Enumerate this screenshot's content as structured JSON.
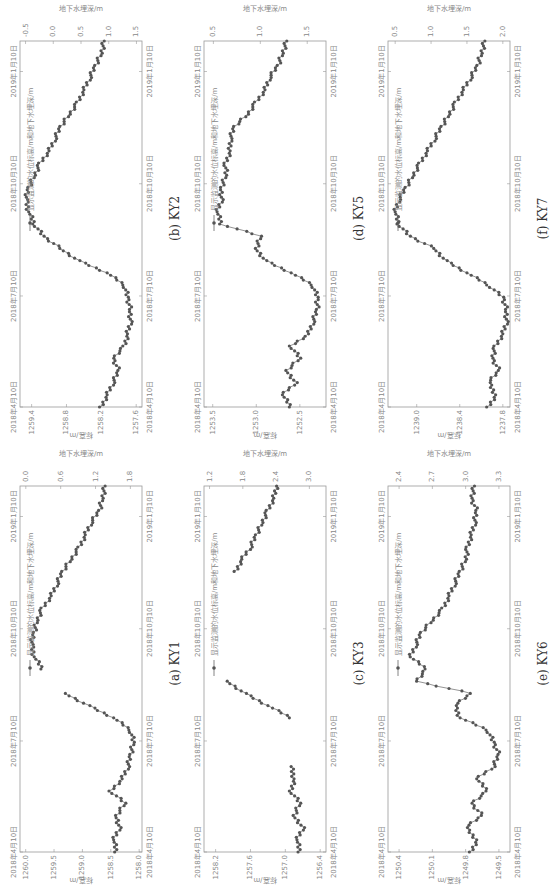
{
  "figure": {
    "legend_label": "显示监测的水位标高/m和地下水埋深/m",
    "left_axis_label": "标高/m",
    "right_axis_label": "地下水埋深/m",
    "x_ticks": [
      "2018年4月10日",
      "2018年7月10日",
      "2018年10月10日",
      "2019年1月10日"
    ]
  },
  "chart_data": [
    {
      "id": "KY1",
      "caption": "(a) KY1",
      "type": "line",
      "title": "(a) KY1",
      "xlabel": "",
      "ylabel": "标高/m",
      "y2label": "地下水埋深/m",
      "x_ticks": [
        "2018年4月10日",
        "2018年7月10日",
        "2018年10月10日",
        "2019年1月10日"
      ],
      "y_ticks": [
        1258.0,
        1258.5,
        1259.0,
        1259.5,
        1260.0
      ],
      "ylim": [
        1257.95,
        1260.1
      ],
      "y2_ticks": [
        0.0,
        0.6,
        1.2,
        1.8
      ],
      "y2lim": [
        -0.1,
        2.0
      ],
      "y2_inverted": true,
      "series": [
        {
          "name": "显示监测的水位标高/m和地下水埋深/m",
          "x_days": [
            0,
            10,
            20,
            30,
            40,
            50,
            60,
            70,
            80,
            90,
            100,
            110,
            120,
            130,
            140,
            150,
            160,
            170,
            180,
            190,
            200,
            210,
            220,
            230,
            240,
            250,
            260,
            270,
            280,
            290,
            300
          ],
          "values": [
            1258.4,
            1258.45,
            1258.35,
            1258.4,
            1258.25,
            1258.5,
            1258.3,
            1258.2,
            1258.15,
            1258.1,
            1258.15,
            1258.45,
            1258.9,
            1259.3,
            null,
            1259.7,
            1259.85,
            1259.9,
            1259.85,
            1259.8,
            1259.7,
            1259.55,
            1259.45,
            1259.35,
            1259.2,
            1259.05,
            1258.95,
            1258.85,
            1258.7,
            1258.65,
            1258.6
          ]
        }
      ]
    },
    {
      "id": "KY2",
      "caption": "(b) KY2",
      "type": "line",
      "title": "(b) KY2",
      "xlabel": "",
      "ylabel": "标高/m",
      "y2label": "地下水埋深/m",
      "x_ticks": [
        "2018年4月10日",
        "2018年7月10日",
        "2018年10月10日",
        "2019年1月10日"
      ],
      "y_ticks": [
        1257.6,
        1258.2,
        1258.8,
        1259.4
      ],
      "ylim": [
        1257.5,
        1259.6
      ],
      "y2_ticks": [
        -0.5,
        0.0,
        0.5,
        1.0,
        1.5
      ],
      "y2lim": [
        -0.6,
        1.6
      ],
      "y2_inverted": true,
      "series": [
        {
          "name": "显示监测的水位标高/m和地下水埋深/m",
          "x_days": [
            0,
            10,
            20,
            30,
            40,
            50,
            60,
            70,
            80,
            90,
            100,
            110,
            120,
            130,
            140,
            150,
            160,
            170,
            180,
            190,
            200,
            210,
            220,
            230,
            240,
            250,
            260,
            270,
            280,
            290,
            300
          ],
          "values": [
            1258.2,
            1258.1,
            1258.0,
            1257.9,
            1258.0,
            1257.8,
            1257.75,
            1257.7,
            1257.7,
            1257.75,
            1257.8,
            1258.1,
            1258.6,
            1258.9,
            1259.2,
            1259.35,
            1259.45,
            1259.5,
            1259.45,
            1259.35,
            1259.25,
            1259.1,
            1259.0,
            1258.9,
            1258.75,
            1258.6,
            1258.5,
            1258.4,
            1258.3,
            1258.2,
            1258.15
          ]
        }
      ]
    },
    {
      "id": "KY3",
      "caption": "(c) KY3",
      "type": "line",
      "title": "(c) KY3",
      "xlabel": "",
      "ylabel": "标高/m",
      "y2label": "地下水埋深/m",
      "x_ticks": [
        "2018年4月10日",
        "2018年7月10日",
        "2018年10月10日",
        "2019年1月10日"
      ],
      "y_ticks": [
        1256.4,
        1257.0,
        1257.6,
        1258.2
      ],
      "ylim": [
        1256.3,
        1258.4
      ],
      "y2_ticks": [
        1.2,
        1.8,
        2.4,
        3.0
      ],
      "y2lim": [
        1.1,
        3.3
      ],
      "y2_inverted": true,
      "series": [
        {
          "name": "显示监测的水位标高/m和地下水埋深/m",
          "x_days": [
            0,
            10,
            20,
            30,
            40,
            50,
            60,
            70,
            80,
            90,
            100,
            110,
            120,
            130,
            140,
            150,
            160,
            170,
            180,
            190,
            200,
            210,
            220,
            230,
            240,
            250,
            260,
            270,
            280,
            290,
            300
          ],
          "values": [
            1256.75,
            1256.8,
            1256.7,
            1256.85,
            1256.75,
            1256.9,
            1256.85,
            1256.9,
            null,
            null,
            null,
            1256.9,
            1257.3,
            1257.7,
            1258.0,
            null,
            null,
            null,
            null,
            null,
            null,
            null,
            null,
            1257.85,
            1257.75,
            1257.6,
            1257.5,
            1257.4,
            1257.3,
            1257.2,
            1257.15
          ]
        }
      ]
    },
    {
      "id": "KY5",
      "caption": "(d) KY5",
      "type": "line",
      "title": "(d) KY5",
      "xlabel": "",
      "ylabel": "标高/m",
      "y2label": "地下水埋深/m",
      "x_ticks": [
        "2018年4月10日",
        "2018年7月10日",
        "2018年10月10日",
        "2019年1月10日"
      ],
      "y_ticks": [
        1252.5,
        1253.0,
        1253.5
      ],
      "ylim": [
        1252.2,
        1253.6
      ],
      "y2_ticks": [
        0.5,
        1.0,
        1.5
      ],
      "y2lim": [
        0.4,
        1.7
      ],
      "y2_inverted": true,
      "series": [
        {
          "name": "显示监测的水位标高/m和地下水埋深/m",
          "x_days": [
            0,
            10,
            20,
            30,
            40,
            50,
            60,
            70,
            80,
            90,
            100,
            110,
            120,
            130,
            140,
            150,
            160,
            170,
            180,
            190,
            200,
            210,
            220,
            230,
            240,
            250,
            260,
            270,
            280,
            290,
            300
          ],
          "values": [
            1252.6,
            1252.7,
            1252.55,
            1252.65,
            1252.5,
            1252.6,
            1252.4,
            1252.35,
            1252.3,
            1252.3,
            1252.35,
            1252.6,
            1252.9,
            1253.0,
            1252.95,
            1253.4,
            1253.45,
            1253.4,
            1253.4,
            1253.35,
            1253.35,
            1253.3,
            1253.3,
            1253.25,
            1253.1,
            1253.0,
            1252.9,
            1252.85,
            1252.75,
            1252.7,
            1252.65
          ]
        }
      ]
    },
    {
      "id": "KY6",
      "caption": "(e) KY6",
      "type": "line",
      "title": "(e) KY6",
      "xlabel": "",
      "ylabel": "标高/m",
      "y2label": "地下水埋深/m",
      "x_ticks": [
        "2018年4月10日",
        "2018年7月10日",
        "2018年10月10日",
        "2019年1月10日"
      ],
      "y_ticks": [
        1249.5,
        1249.8,
        1250.1,
        1250.4
      ],
      "ylim": [
        1249.4,
        1250.5
      ],
      "y2_ticks": [
        2.4,
        2.7,
        3.0,
        3.3
      ],
      "y2lim": [
        2.3,
        3.4
      ],
      "y2_inverted": true,
      "series": [
        {
          "name": "显示监测的水位标高/m和地下水埋深/m",
          "x_days": [
            0,
            10,
            20,
            30,
            40,
            50,
            60,
            70,
            80,
            90,
            100,
            110,
            120,
            130,
            140,
            150,
            160,
            170,
            180,
            190,
            200,
            210,
            220,
            230,
            240,
            250,
            260,
            270,
            280,
            290,
            300
          ],
          "values": [
            1249.75,
            1249.7,
            1249.8,
            1249.65,
            1249.75,
            1249.6,
            1249.7,
            1249.55,
            1249.5,
            1249.55,
            1249.6,
            1249.85,
            1249.9,
            1249.75,
            1250.25,
            1250.15,
            1250.3,
            1250.25,
            1250.2,
            1250.1,
            1250.0,
            1249.95,
            1249.9,
            1249.85,
            1249.8,
            1249.78,
            1249.75,
            1249.72,
            1249.7,
            1249.75,
            1249.72
          ]
        }
      ]
    },
    {
      "id": "KY7",
      "caption": "(f) KY7",
      "type": "line",
      "title": "(f) KY7",
      "xlabel": "",
      "ylabel": "标高/m",
      "y2label": "地下水埋深/m",
      "x_ticks": [
        "2018年4月10日",
        "2018年7月10日",
        "2018年10月10日",
        "2019年1月10日"
      ],
      "y_ticks": [
        1237.8,
        1238.4,
        1239.0
      ],
      "ylim": [
        1237.7,
        1239.4
      ],
      "y2_ticks": [
        0.5,
        1.0,
        1.5,
        2.0
      ],
      "y2lim": [
        0.4,
        2.1
      ],
      "y2_inverted": true,
      "series": [
        {
          "name": "显示监测的水位标高/m和地下水埋深/m",
          "x_days": [
            0,
            10,
            20,
            30,
            40,
            50,
            60,
            70,
            80,
            90,
            100,
            110,
            120,
            130,
            140,
            150,
            160,
            170,
            180,
            190,
            200,
            210,
            220,
            230,
            240,
            250,
            260,
            270,
            280,
            290,
            300
          ],
          "values": [
            1238.0,
            1237.9,
            1238.0,
            1237.85,
            1237.95,
            1237.9,
            1237.8,
            1237.75,
            1237.75,
            1237.8,
            1238.0,
            1238.3,
            1238.6,
            1238.75,
            1239.1,
            1239.25,
            1239.3,
            1239.25,
            1239.15,
            1239.05,
            1238.95,
            1238.85,
            1238.75,
            1238.65,
            1238.55,
            1238.45,
            1238.35,
            1238.25,
            1238.15,
            1238.1,
            1238.05
          ]
        }
      ]
    }
  ]
}
